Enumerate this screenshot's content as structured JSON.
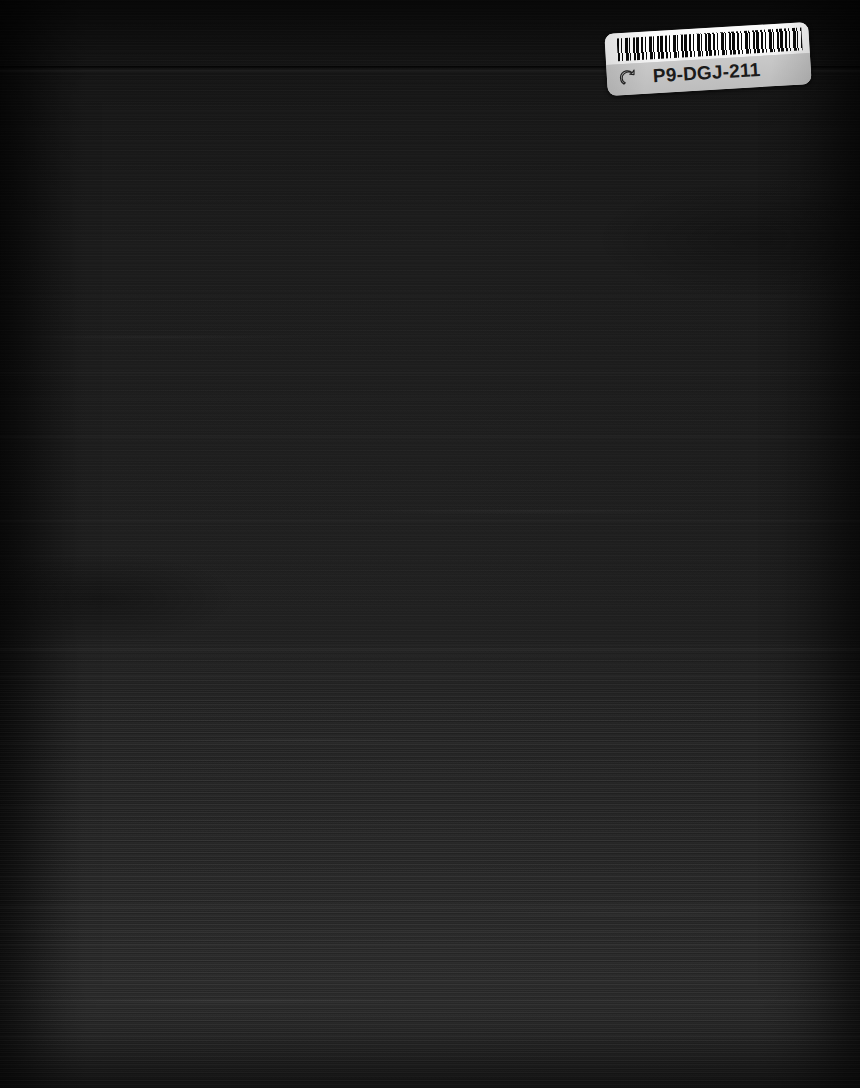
{
  "document": {
    "type": "scanned-book-cover",
    "surface_label": "dark book cover scan",
    "width": 860,
    "height": 1088,
    "background_color": "#1a1a1a",
    "streak_color": "#3a3a3a"
  },
  "barcode_label": {
    "code_text": "P9-DGJ-211",
    "icon_name": "pointing-hand-icon",
    "top_band_color": "#f7f7f7",
    "bottom_band_color": "#c4c4c4",
    "barcode_name": "barcode-bars",
    "rotation_degrees": -3.4
  },
  "streaks": [
    {
      "top": 70,
      "height": 2,
      "opacity": 0.2
    },
    {
      "top": 128,
      "height": 1,
      "opacity": 0.1
    },
    {
      "top": 296,
      "height": 1,
      "opacity": 0.12
    },
    {
      "top": 372,
      "height": 2,
      "opacity": 0.16
    },
    {
      "top": 398,
      "height": 1,
      "opacity": 0.13
    },
    {
      "top": 436,
      "height": 2,
      "opacity": 0.18
    },
    {
      "top": 492,
      "height": 1,
      "opacity": 0.12
    },
    {
      "top": 520,
      "height": 2,
      "opacity": 0.15
    },
    {
      "top": 556,
      "height": 1,
      "opacity": 0.11
    },
    {
      "top": 592,
      "height": 1,
      "opacity": 0.1
    },
    {
      "top": 648,
      "height": 3,
      "opacity": 0.22
    },
    {
      "top": 676,
      "height": 2,
      "opacity": 0.18
    },
    {
      "top": 700,
      "height": 1,
      "opacity": 0.12
    },
    {
      "top": 742,
      "height": 2,
      "opacity": 0.2
    },
    {
      "top": 766,
      "height": 1,
      "opacity": 0.14
    },
    {
      "top": 806,
      "height": 2,
      "opacity": 0.18
    },
    {
      "top": 838,
      "height": 1,
      "opacity": 0.12
    },
    {
      "top": 876,
      "height": 2,
      "opacity": 0.2
    },
    {
      "top": 906,
      "height": 3,
      "opacity": 0.26
    },
    {
      "top": 930,
      "height": 2,
      "opacity": 0.24
    },
    {
      "top": 944,
      "height": 2,
      "opacity": 0.22
    },
    {
      "top": 962,
      "height": 1,
      "opacity": 0.16
    },
    {
      "top": 980,
      "height": 2,
      "opacity": 0.22
    },
    {
      "top": 1000,
      "height": 2,
      "opacity": 0.2
    },
    {
      "top": 1018,
      "height": 1,
      "opacity": 0.15
    },
    {
      "top": 1036,
      "height": 2,
      "opacity": 0.22
    },
    {
      "top": 1056,
      "height": 2,
      "opacity": 0.18
    },
    {
      "top": 1072,
      "height": 1,
      "opacity": 0.14
    }
  ]
}
